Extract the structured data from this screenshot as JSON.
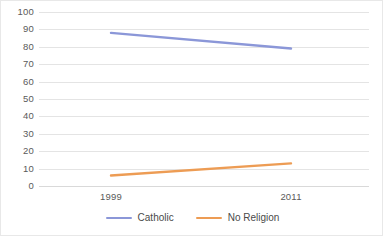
{
  "chart_data": {
    "type": "line",
    "title": "",
    "subtitle": "",
    "xlabel": "",
    "ylabel": "",
    "categories": [
      "1999",
      "2011"
    ],
    "x": [
      1999,
      2011
    ],
    "series": [
      {
        "name": "Catholic",
        "values": [
          88,
          79
        ],
        "color": "#8b97d8"
      },
      {
        "name": "No Religion",
        "values": [
          6,
          13
        ],
        "color": "#ed9c54"
      }
    ],
    "ylim": [
      0,
      100
    ],
    "ytick_step": 10,
    "yticks": [
      100,
      90,
      80,
      70,
      60,
      50,
      40,
      30,
      20,
      10,
      0
    ],
    "grid": true,
    "grid_axis": "y",
    "legend_position": "bottom",
    "annotations": []
  },
  "axes": {
    "y_ticks": [
      "100",
      "90",
      "80",
      "70",
      "60",
      "50",
      "40",
      "30",
      "20",
      "10",
      "0"
    ],
    "x_ticks": [
      "1999",
      "2011"
    ]
  },
  "legend": {
    "items": [
      {
        "label": "Catholic",
        "color": "#8b97d8"
      },
      {
        "label": "No Religion",
        "color": "#ed9c54"
      }
    ]
  },
  "colors": {
    "gridline": "#e4e4e4",
    "baseline": "#d9d9d9",
    "tick_text": "#5a5a5a",
    "legend_text": "#4a4a4a",
    "background": "#ffffff",
    "border": "#e8e8e8"
  }
}
